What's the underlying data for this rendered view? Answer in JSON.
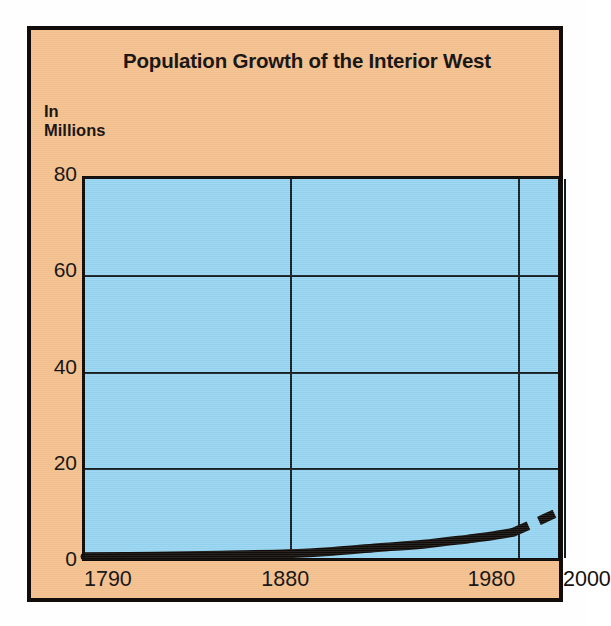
{
  "chart_data": {
    "type": "line",
    "title": "Population Growth of the Interior West",
    "subtitle": "",
    "ylabel_line1": "In",
    "ylabel_line2": "Millions",
    "xlabel": "",
    "ylim": [
      0,
      80
    ],
    "xlim": [
      1790,
      2000
    ],
    "yticks": [
      80,
      60,
      40,
      20,
      0
    ],
    "ytick_labels": [
      "80",
      "60",
      "40",
      "20",
      "0"
    ],
    "xticks": [
      1790,
      1880,
      1980,
      2000
    ],
    "xtick_labels": [
      "1790",
      "1880",
      "1980",
      "2000"
    ],
    "grid": "both",
    "legend": "none",
    "colors": {
      "panel_background": "#f4c190",
      "plot_background": "#96d5f2",
      "line": "#100c09",
      "frame": "#120d0a",
      "text": "#151210"
    },
    "series": [
      {
        "name": "Interior West population (historical)",
        "style": "solid",
        "x": [
          1790,
          1820,
          1850,
          1880,
          1900,
          1920,
          1940,
          1960,
          1970,
          1980
        ],
        "values": [
          0.3,
          0.4,
          0.6,
          0.9,
          1.4,
          2.2,
          2.9,
          4.0,
          4.6,
          5.4
        ]
      },
      {
        "name": "Interior West population (projected)",
        "style": "dashed",
        "x": [
          1980,
          1990,
          2000
        ],
        "values": [
          5.4,
          7.5,
          9.7
        ]
      }
    ],
    "annotations": [
      "Solid line shows historical population 1790-1980",
      "Dashed line shows projection 1980-2000"
    ]
  }
}
